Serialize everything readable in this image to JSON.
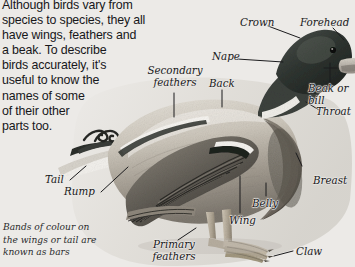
{
  "page": {
    "background_color": "#eceae7",
    "width": 355,
    "height": 267
  },
  "body_text": "Although birds vary from\nspecies to species, they all\nhave wings, feathers and\na beak. To describe\nbirds accurately, it's\nuseful to know the\nnames of some\nof their other\nparts too.",
  "caption": "Bands of colour on\nthe wings or tail are\nknown as bars",
  "labels": [
    {
      "id": "crown",
      "text": "Crown"
    },
    {
      "id": "forehead",
      "text": "Forehead"
    },
    {
      "id": "nape",
      "text": "Nape"
    },
    {
      "id": "beak-or-bill",
      "text": "Beak or bill"
    },
    {
      "id": "throat",
      "text": "Throat"
    },
    {
      "id": "back",
      "text": "Back"
    },
    {
      "id": "secondary-feathers",
      "text": "Secondary\nfeathers"
    },
    {
      "id": "breast",
      "text": "Breast"
    },
    {
      "id": "belly",
      "text": "Belly"
    },
    {
      "id": "wing",
      "text": "Wing"
    },
    {
      "id": "claw",
      "text": "Claw"
    },
    {
      "id": "primary-feathers",
      "text": "Primary\nfeathers"
    },
    {
      "id": "rump",
      "text": "Rump"
    },
    {
      "id": "tail",
      "text": "Tail"
    }
  ],
  "colors": {
    "background": "#eceae7",
    "text": "#17171a",
    "label_text": "#18181a",
    "leader_line": "#1b1b1d",
    "head_dark": "#2e3330",
    "body_mid": "#9a958c",
    "body_light": "#d8d4cc",
    "wing_dark": "#4a4843",
    "leg_tan": "#b5ab9b"
  }
}
